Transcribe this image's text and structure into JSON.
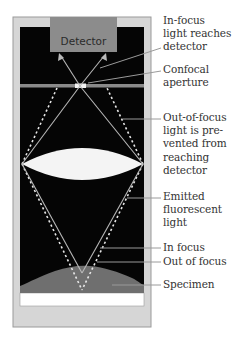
{
  "diagram": {
    "components": {
      "detector": {
        "label": "Detector"
      }
    },
    "labels": [
      {
        "id": "in-focus-light",
        "lines": [
          "In-focus",
          "light reaches",
          "detector"
        ]
      },
      {
        "id": "confocal-aperture",
        "lines": [
          "Confocal",
          "aperture"
        ]
      },
      {
        "id": "out-of-focus-blocked",
        "lines": [
          "Out-of-focus",
          "light is pre-",
          "vented from",
          "reaching",
          "detector"
        ]
      },
      {
        "id": "emitted-light",
        "lines": [
          "Emitted",
          "fluorescent",
          "light"
        ]
      },
      {
        "id": "in-focus",
        "lines": [
          "In focus"
        ]
      },
      {
        "id": "out-of-focus",
        "lines": [
          "Out of focus"
        ]
      },
      {
        "id": "specimen",
        "lines": [
          "Specimen"
        ]
      }
    ],
    "colors": {
      "frame": "#d6d6d6",
      "frame_border": "#9a9a9a",
      "interior": "#050505",
      "detector": "#8c8c8c",
      "aperture": "#8a8a8a",
      "lens": "#f4f4f4",
      "light_path": "#b8b8b8",
      "specimen": "#6f6f6f",
      "leader": "#9a9a9a"
    }
  }
}
